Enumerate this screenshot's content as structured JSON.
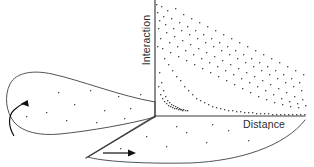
{
  "figure": {
    "title": "",
    "background_color": "#ffffff",
    "line_color": "#3a3a3a",
    "dot_color": "#4d4d4d",
    "arrow_color": "#111111"
  },
  "axes": {
    "vertical": {
      "label": "Interaction",
      "orientation": "vertical-rotated-ccw",
      "x": 155,
      "y_top": 0,
      "y_bottom": 116
    },
    "horizontal": {
      "label": "Distance",
      "orientation": "horizontal",
      "y": 116,
      "x_left": 155,
      "x_right": 305
    },
    "depth": {
      "label": "",
      "orientation": "diagonal-down-left",
      "x_start": 155,
      "y_start": 116,
      "x_end": 85,
      "y_end": 160
    }
  },
  "origin": {
    "x": 155,
    "y": 116
  },
  "lobes": [
    {
      "name": "left-lobe",
      "description": "elongated closed loop extending to the left of the origin",
      "arrow": {
        "name": "rotation-arrow",
        "direction": "counter-clockwise-up",
        "style": "curved"
      }
    },
    {
      "name": "bottom-lobe",
      "description": "elongated wedge extending to the lower right of the origin",
      "arrow": {
        "name": "translation-arrow",
        "direction": "right",
        "style": "straight"
      }
    }
  ],
  "chart_data": {
    "type": "scatter",
    "title": "",
    "xlabel": "Distance",
    "ylabel": "Interaction",
    "grid": false,
    "legend": null,
    "xlim": [
      0,
      150
    ],
    "ylim": [
      0,
      116
    ],
    "series": [
      {
        "name": "interaction-vs-distance",
        "points": [
          [
            2,
            104
          ],
          [
            4,
            96
          ],
          [
            3,
            88
          ],
          [
            6,
            110
          ],
          [
            5,
            78
          ],
          [
            8,
            100
          ],
          [
            7,
            68
          ],
          [
            10,
            92
          ],
          [
            9,
            58
          ],
          [
            12,
            106
          ],
          [
            11,
            84
          ],
          [
            14,
            74
          ],
          [
            13,
            52
          ],
          [
            16,
            98
          ],
          [
            15,
            64
          ],
          [
            18,
            88
          ],
          [
            17,
            46
          ],
          [
            20,
            108
          ],
          [
            19,
            80
          ],
          [
            22,
            70
          ],
          [
            21,
            40
          ],
          [
            24,
            94
          ],
          [
            23,
            60
          ],
          [
            26,
            86
          ],
          [
            25,
            36
          ],
          [
            28,
            102
          ],
          [
            27,
            76
          ],
          [
            30,
            66
          ],
          [
            29,
            30
          ],
          [
            32,
            90
          ],
          [
            31,
            56
          ],
          [
            34,
            82
          ],
          [
            33,
            26
          ],
          [
            36,
            98
          ],
          [
            35,
            72
          ],
          [
            38,
            62
          ],
          [
            37,
            22
          ],
          [
            40,
            86
          ],
          [
            39,
            52
          ],
          [
            42,
            78
          ],
          [
            41,
            18
          ],
          [
            44,
            94
          ],
          [
            43,
            68
          ],
          [
            46,
            58
          ],
          [
            45,
            16
          ],
          [
            48,
            82
          ],
          [
            47,
            48
          ],
          [
            50,
            74
          ],
          [
            49,
            14
          ],
          [
            52,
            90
          ],
          [
            51,
            64
          ],
          [
            54,
            54
          ],
          [
            53,
            12
          ],
          [
            56,
            78
          ],
          [
            55,
            44
          ],
          [
            58,
            70
          ],
          [
            57,
            10
          ],
          [
            60,
            86
          ],
          [
            59,
            60
          ],
          [
            62,
            50
          ],
          [
            61,
            9
          ],
          [
            64,
            74
          ],
          [
            63,
            40
          ],
          [
            66,
            66
          ],
          [
            65,
            8
          ],
          [
            68,
            82
          ],
          [
            67,
            56
          ],
          [
            70,
            46
          ],
          [
            69,
            7
          ],
          [
            72,
            70
          ],
          [
            71,
            36
          ],
          [
            74,
            62
          ],
          [
            73,
            6
          ],
          [
            76,
            78
          ],
          [
            75,
            52
          ],
          [
            78,
            42
          ],
          [
            77,
            6
          ],
          [
            80,
            66
          ],
          [
            79,
            32
          ],
          [
            82,
            58
          ],
          [
            81,
            5
          ],
          [
            84,
            74
          ],
          [
            83,
            48
          ],
          [
            86,
            38
          ],
          [
            85,
            5
          ],
          [
            88,
            62
          ],
          [
            87,
            28
          ],
          [
            90,
            54
          ],
          [
            89,
            4
          ],
          [
            92,
            70
          ],
          [
            91,
            44
          ],
          [
            94,
            34
          ],
          [
            93,
            4
          ],
          [
            96,
            58
          ],
          [
            95,
            24
          ],
          [
            98,
            50
          ],
          [
            97,
            4
          ],
          [
            100,
            66
          ],
          [
            99,
            40
          ],
          [
            102,
            30
          ],
          [
            101,
            3
          ],
          [
            104,
            54
          ],
          [
            103,
            20
          ],
          [
            106,
            46
          ],
          [
            105,
            3
          ],
          [
            108,
            62
          ],
          [
            107,
            36
          ],
          [
            110,
            26
          ],
          [
            109,
            3
          ],
          [
            112,
            50
          ],
          [
            111,
            17
          ],
          [
            114,
            42
          ],
          [
            113,
            3
          ],
          [
            116,
            58
          ],
          [
            115,
            32
          ],
          [
            118,
            22
          ],
          [
            117,
            2
          ],
          [
            120,
            46
          ],
          [
            119,
            14
          ],
          [
            122,
            38
          ],
          [
            121,
            2
          ],
          [
            124,
            54
          ],
          [
            123,
            28
          ],
          [
            126,
            18
          ],
          [
            125,
            2
          ],
          [
            128,
            42
          ],
          [
            127,
            12
          ],
          [
            130,
            34
          ],
          [
            129,
            2
          ],
          [
            132,
            50
          ],
          [
            131,
            24
          ],
          [
            134,
            15
          ],
          [
            133,
            2
          ],
          [
            136,
            38
          ],
          [
            135,
            10
          ],
          [
            138,
            30
          ],
          [
            137,
            2
          ],
          [
            140,
            46
          ],
          [
            139,
            20
          ],
          [
            142,
            13
          ],
          [
            141,
            2
          ],
          [
            144,
            34
          ],
          [
            143,
            9
          ],
          [
            146,
            26
          ],
          [
            145,
            2
          ],
          [
            148,
            42
          ],
          [
            147,
            17
          ],
          [
            150,
            11
          ],
          [
            149,
            2
          ],
          [
            1,
            112
          ],
          [
            2,
            70
          ],
          [
            4,
            44
          ],
          [
            6,
            34
          ],
          [
            3,
            30
          ],
          [
            8,
            26
          ],
          [
            5,
            22
          ],
          [
            10,
            20
          ],
          [
            7,
            18
          ],
          [
            12,
            16
          ],
          [
            9,
            15
          ],
          [
            14,
            14
          ],
          [
            11,
            13
          ],
          [
            16,
            12
          ],
          [
            13,
            11
          ],
          [
            18,
            11
          ],
          [
            15,
            10
          ],
          [
            20,
            10
          ],
          [
            17,
            9
          ],
          [
            22,
            9
          ],
          [
            19,
            8
          ],
          [
            24,
            8
          ],
          [
            21,
            8
          ],
          [
            26,
            7
          ],
          [
            23,
            7
          ],
          [
            28,
            7
          ],
          [
            25,
            7
          ],
          [
            30,
            6
          ],
          [
            27,
            6
          ],
          [
            32,
            6
          ]
        ]
      }
    ]
  }
}
